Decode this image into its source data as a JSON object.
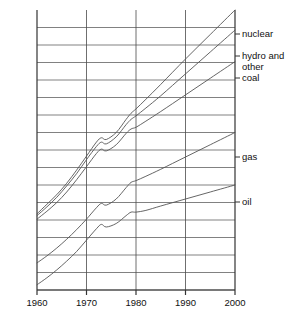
{
  "chart_data": {
    "type": "line",
    "title": "",
    "subtitle": "",
    "xlabel": "",
    "ylabel": "annual world energy demand",
    "xlim": [
      1960,
      2000
    ],
    "ylim": [
      0,
      16
    ],
    "grid": true,
    "grid_x": true,
    "grid_y": true,
    "legend_position": "right-inline-labels",
    "axis_note": "y axis unlabelled (no numeric tick values shown); 16 horizontal gridlines",
    "xticks": [
      1960,
      1970,
      1980,
      1990,
      2000
    ],
    "xtick_labels": [
      "1960",
      "1970",
      "1980",
      "1990",
      "2000"
    ],
    "yticks": [
      0,
      1,
      2,
      3,
      4,
      5,
      6,
      7,
      8,
      9,
      10,
      11,
      12,
      13,
      14,
      15,
      16
    ],
    "ytick_labels": [
      "",
      "",
      "",
      "",
      "",
      "",
      "",
      "",
      "",
      "",
      "",
      "",
      "",
      "",
      "",
      "",
      ""
    ],
    "x": [
      1960,
      1962,
      1964,
      1966,
      1968,
      1970,
      1972,
      1973,
      1974,
      1976,
      1978,
      1979,
      1980,
      1982,
      1985,
      1990,
      1995,
      2000
    ],
    "series": [
      {
        "name": "oil",
        "label": "oil",
        "values": [
          0.3,
          0.7,
          1.15,
          1.65,
          2.2,
          2.85,
          3.5,
          3.75,
          3.6,
          3.8,
          4.25,
          4.45,
          4.45,
          4.55,
          4.8,
          5.2,
          5.6,
          6.0
        ]
      },
      {
        "name": "gas",
        "label": "gas",
        "values": [
          1.55,
          1.95,
          2.4,
          2.9,
          3.45,
          4.05,
          4.7,
          4.95,
          4.85,
          5.2,
          5.85,
          6.15,
          6.25,
          6.5,
          6.9,
          7.6,
          8.3,
          9.0
        ]
      },
      {
        "name": "coal",
        "label": "coal",
        "values": [
          4.05,
          4.5,
          5.0,
          5.6,
          6.3,
          7.05,
          7.8,
          8.05,
          7.95,
          8.3,
          8.95,
          9.2,
          9.3,
          9.65,
          10.2,
          11.15,
          12.1,
          13.05
        ]
      },
      {
        "name": "hydro and other",
        "label": "hydro and other",
        "values": [
          4.25,
          4.75,
          5.3,
          5.95,
          6.65,
          7.45,
          8.2,
          8.45,
          8.35,
          8.75,
          9.45,
          9.75,
          9.95,
          10.4,
          11.1,
          12.35,
          13.6,
          14.85
        ]
      },
      {
        "name": "nuclear",
        "label": "nuclear",
        "values": [
          4.35,
          4.9,
          5.45,
          6.1,
          6.85,
          7.65,
          8.45,
          8.7,
          8.6,
          9.0,
          9.75,
          10.1,
          10.35,
          10.9,
          11.75,
          13.2,
          14.6,
          16.0
        ]
      }
    ]
  },
  "axes": {
    "y_title": "annual world energy demand"
  },
  "xticks": {
    "t0": "1960",
    "t1": "1970",
    "t2": "1980",
    "t3": "1990",
    "t4": "2000"
  },
  "labels": {
    "nuclear": "nuclear",
    "hydro_and": "hydro and",
    "other": "other",
    "coal": "coal",
    "gas": "gas",
    "oil": "oil"
  },
  "colors": {
    "line": "#555555",
    "grid": "#4a4a4a",
    "axis": "#333333",
    "text": "#111111",
    "background": "#ffffff"
  }
}
